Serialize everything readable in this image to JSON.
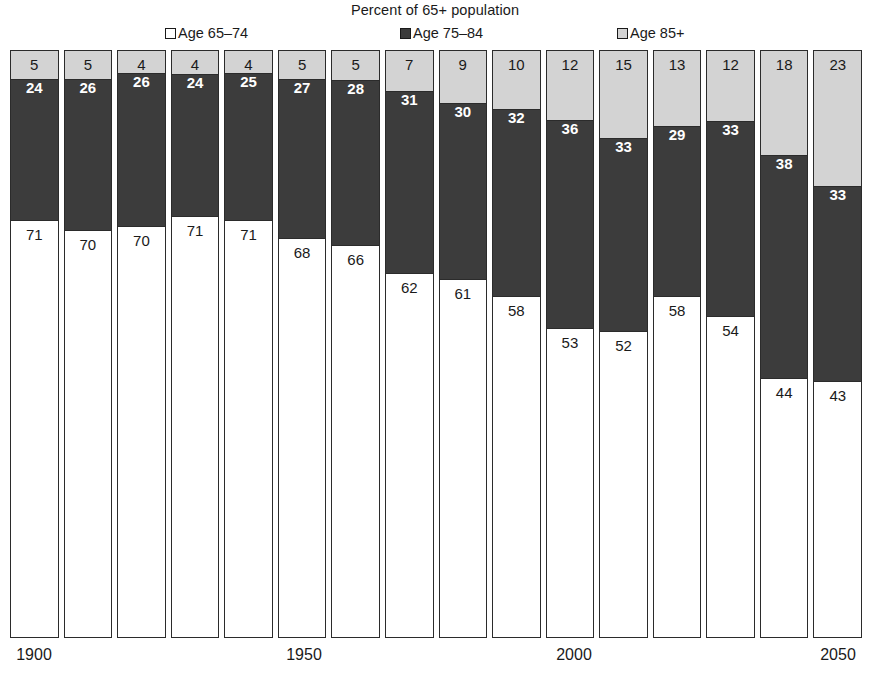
{
  "chart_data": {
    "type": "bar",
    "title": "Percent of 65+ population",
    "subtitle": "",
    "xlabel": "",
    "ylabel": "",
    "stacked": true,
    "grid": false,
    "legend_position": "top",
    "ylim": [
      0,
      100
    ],
    "categories": [
      "1900",
      "1910",
      "1920",
      "1930",
      "1940",
      "1950",
      "1960",
      "1970",
      "1980",
      "1990",
      "2000",
      "2010",
      "2020",
      "2030",
      "2040",
      "2050"
    ],
    "x_tick_labels": [
      "1900",
      "1950",
      "2000",
      "2050"
    ],
    "x_tick_indices": [
      0,
      5,
      10,
      15
    ],
    "series": [
      {
        "name": "Age 65–74",
        "color": "#ffffff",
        "values": [
          71,
          70,
          70,
          71,
          71,
          68,
          66,
          62,
          61,
          58,
          53,
          52,
          58,
          54,
          44,
          43
        ]
      },
      {
        "name": "Age 75–84",
        "color": "#3c3c3c",
        "values": [
          24,
          26,
          26,
          24,
          25,
          27,
          28,
          31,
          30,
          32,
          36,
          33,
          29,
          33,
          38,
          33
        ]
      },
      {
        "name": "Age 85+",
        "color": "#d3d3d3",
        "values": [
          5,
          5,
          4,
          4,
          4,
          5,
          5,
          7,
          9,
          10,
          12,
          15,
          13,
          12,
          18,
          23
        ]
      }
    ]
  },
  "legend": {
    "items": [
      {
        "label": "Age 65–74",
        "color": "#ffffff"
      },
      {
        "label": "Age 75–84",
        "color": "#3c3c3c"
      },
      {
        "label": "Age 85+",
        "color": "#d3d3d3"
      }
    ]
  },
  "axis": {
    "ticks": [
      {
        "label": "1900",
        "x": 34
      },
      {
        "label": "1950",
        "x": 304
      },
      {
        "label": "2000",
        "x": 574
      },
      {
        "label": "2050",
        "x": 838
      }
    ]
  }
}
